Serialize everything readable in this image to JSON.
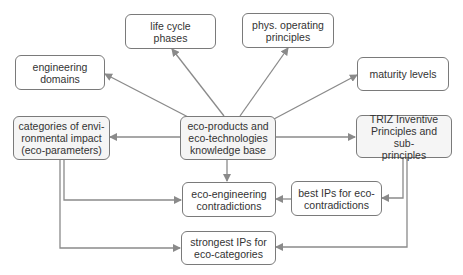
{
  "diagram": {
    "colors": {
      "box_border": "#7a7a7a",
      "box_fill": "#ffffff",
      "box_fill_shaded": "#f5f5f5",
      "edge": "#8a8a8a",
      "text": "#333333"
    },
    "nodes": {
      "life_cycle": {
        "label": "life cycle\nphases"
      },
      "phys_principles": {
        "label": "phys. operating\nprinciples"
      },
      "engineering_domains": {
        "label": "engineering\ndomains"
      },
      "maturity_levels": {
        "label": "maturity levels"
      },
      "categories": {
        "label": "categories of envi-\nronmental impact\n(eco-parameters)"
      },
      "knowledge_base": {
        "label": "eco-products and\neco-technologies\nknowledge base"
      },
      "triz": {
        "label": "TRIZ Inventive\nPrinciples and sub-\nprinciples"
      },
      "eco_contradictions": {
        "label": "eco-engineering\ncontradictions"
      },
      "best_ips": {
        "label": "best IPs for eco-\ncontradictions"
      },
      "strongest_ips": {
        "label": "strongest IPs for\neco-categories"
      }
    },
    "edges": [
      {
        "from": "knowledge_base",
        "to": "life_cycle"
      },
      {
        "from": "knowledge_base",
        "to": "phys_principles"
      },
      {
        "from": "knowledge_base",
        "to": "engineering_domains"
      },
      {
        "from": "knowledge_base",
        "to": "maturity_levels"
      },
      {
        "from": "knowledge_base",
        "to": "categories"
      },
      {
        "from": "knowledge_base",
        "to": "triz"
      },
      {
        "from": "knowledge_base",
        "to": "eco_contradictions"
      },
      {
        "from": "categories",
        "to": "eco_contradictions"
      },
      {
        "from": "categories",
        "to": "strongest_ips"
      },
      {
        "from": "triz",
        "to": "best_ips"
      },
      {
        "from": "triz",
        "to": "strongest_ips"
      },
      {
        "from": "best_ips",
        "to": "eco_contradictions"
      }
    ]
  }
}
